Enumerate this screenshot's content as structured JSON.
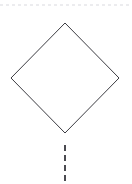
{
  "canvas": {
    "width": 132,
    "height": 184,
    "background_color": "#ffffff"
  },
  "diagram": {
    "type": "flowchart-fragment",
    "title": "",
    "nodes": [
      {
        "id": "decision-node",
        "shape": "diamond",
        "label": "",
        "fill_color": "#ffffff",
        "stroke_color": "#3c3c42",
        "stroke_width": 1,
        "center_x": 65,
        "center_y": 78,
        "half_width": 54,
        "half_height": 55,
        "top_vertex": {
          "x": 65,
          "y": 23
        },
        "right_vertex": {
          "x": 119,
          "y": 78
        },
        "bottom_vertex": {
          "x": 65,
          "y": 133
        },
        "left_vertex": {
          "x": 11,
          "y": 78
        }
      }
    ],
    "connectors": [
      {
        "id": "top-boundary-line",
        "orientation": "horizontal",
        "style": "dashed",
        "stroke_color": "#d9d9de",
        "stroke_width": 1,
        "dash_length": 3,
        "gap_length": 3,
        "x1": 0,
        "y1": 5,
        "x2": 132,
        "y2": 5
      },
      {
        "id": "bottom-connector-line",
        "orientation": "vertical",
        "style": "dashed",
        "stroke_color": "#4a4a50",
        "stroke_width": 2,
        "dash_length": 6,
        "gap_length": 4,
        "x1": 65,
        "y1": 145,
        "x2": 65,
        "y2": 184
      }
    ]
  }
}
